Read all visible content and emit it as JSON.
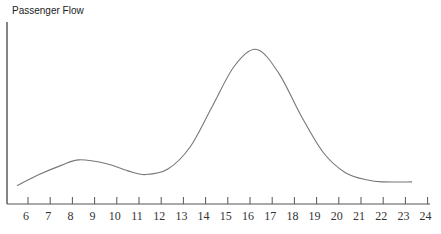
{
  "chart_data": {
    "type": "line",
    "title": "Passenger Flow",
    "ylabel": "Passenger Flow",
    "xlabel": "",
    "x_ticks": [
      6,
      7,
      8,
      9,
      10,
      11,
      12,
      13,
      14,
      15,
      16,
      17,
      18,
      19,
      20,
      21,
      22,
      23,
      24
    ],
    "xlim": [
      5.5,
      24
    ],
    "ylim": [
      0,
      100
    ],
    "grid": false,
    "legend": null,
    "series": [
      {
        "name": "Passenger Flow",
        "x": [
          5.5,
          6.5,
          7.5,
          8.3,
          9.5,
          10.5,
          11.3,
          12.3,
          13.3,
          14.3,
          15.3,
          16.3,
          17.3,
          18.3,
          19.3,
          20.3,
          21.3,
          22.0,
          23.3
        ],
        "values": [
          10,
          16,
          21,
          24,
          22,
          18,
          16,
          19,
          31,
          53,
          75,
          84,
          71,
          48,
          28,
          17,
          13,
          12,
          12
        ]
      }
    ]
  },
  "labels": {
    "title": "Passenger Flow",
    "ticks": [
      "6",
      "7",
      "8",
      "9",
      "10",
      "11",
      "12",
      "13",
      "14",
      "15",
      "16",
      "17",
      "18",
      "19",
      "20",
      "21",
      "22",
      "23",
      "24"
    ]
  }
}
